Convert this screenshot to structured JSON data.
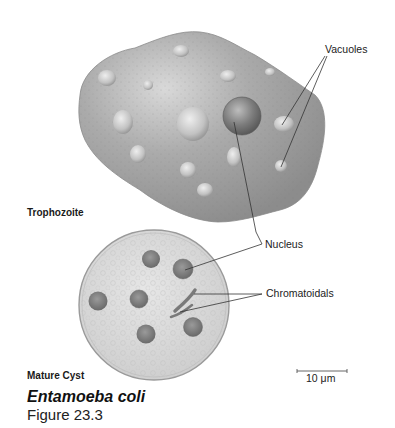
{
  "figure": {
    "title": "Entamoeba coli",
    "caption": "Figure 23.3"
  },
  "labels": {
    "vacuoles": "Vacuoles",
    "nucleus": "Nucleus",
    "chromatoidals": "Chromatoidals",
    "trophozoite": "Trophozoite",
    "mature_cyst": "Mature Cyst"
  },
  "scale_bar": {
    "label": "10 μm"
  },
  "colors": {
    "trophozoite_fill": "#a9a9a9",
    "cyst_fill": "#d8d8d8",
    "nucleus_fill": "#7a7a7a",
    "leader_line": "#333333"
  }
}
